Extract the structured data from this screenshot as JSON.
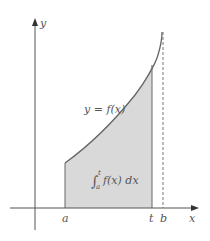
{
  "diagram": {
    "type": "definite-integral-area",
    "axes": {
      "x_label": "x",
      "y_label": "y"
    },
    "curve_label": "y = f(x)",
    "area_label": {
      "integral_sign": "∫",
      "lower": "a",
      "upper": "t",
      "integrand": "f(x) dx"
    },
    "tick_labels": {
      "a": "a",
      "t": "t",
      "b": "b"
    },
    "colors": {
      "shade": "#d9d9d9",
      "curve": "#666666",
      "axis": "#555555",
      "text": "#555555"
    }
  }
}
